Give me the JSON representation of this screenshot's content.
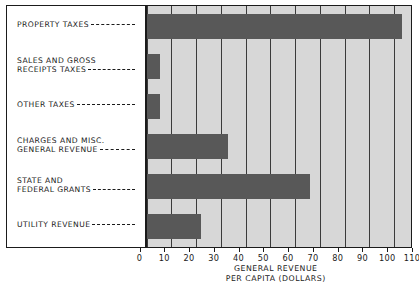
{
  "chart_data": {
    "type": "bar",
    "orientation": "horizontal",
    "title": "",
    "xlabel_lines": [
      "GENERAL REVENUE",
      "PER CAPITA (DOLLARS)"
    ],
    "ylabel": "",
    "xlim": [
      0,
      110
    ],
    "xticks": [
      0,
      10,
      20,
      30,
      40,
      50,
      60,
      70,
      80,
      90,
      100,
      110
    ],
    "xtick_labels": [
      "0",
      "10",
      "20",
      "30",
      "40",
      "50",
      "60",
      "70",
      "80",
      "90",
      "100",
      "110"
    ],
    "grid": true,
    "grid_axis": "x",
    "legend": false,
    "categories": [
      "PROPERTY TAXES",
      "SALES AND GROSS RECEIPTS TAXES",
      "OTHER TAXES",
      "CHARGES AND MISC. GENERAL REVENUE",
      "STATE AND FEDERAL GRANTS",
      "UTILITY REVENUE"
    ],
    "values": [
      103,
      5.5,
      5.5,
      33,
      66,
      22
    ],
    "bar_color": "#585858",
    "plot_background": "#d7d7d7",
    "axis_color": "#1b1b1b"
  },
  "labels": [
    {
      "lines": [
        "PROPERTY TAXES"
      ]
    },
    {
      "lines": [
        "SALES AND GROSS",
        "RECEIPTS TAXES"
      ]
    },
    {
      "lines": [
        "OTHER TAXES"
      ]
    },
    {
      "lines": [
        "CHARGES AND MISC.",
        "GENERAL REVENUE"
      ]
    },
    {
      "lines": [
        "STATE AND",
        "FEDERAL GRANTS"
      ]
    },
    {
      "lines": [
        "UTILITY REVENUE"
      ]
    }
  ],
  "axis": {
    "title_line_1": "GENERAL REVENUE",
    "title_line_2": "PER CAPITA (DOLLARS)"
  }
}
